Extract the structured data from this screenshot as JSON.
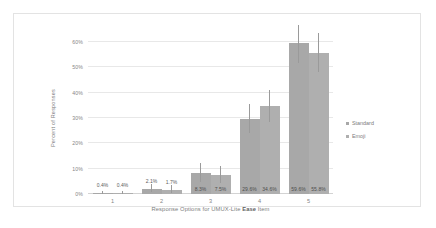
{
  "chart_data": {
    "type": "bar",
    "title": "",
    "xlabel_parts": {
      "before": "Response Options for UMUX-Lite ",
      "bold": "Ease",
      "after": " Item"
    },
    "xlabel": "Response Options for UMUX-Lite Ease Item",
    "ylabel": "Percent of Responses",
    "categories": [
      "1",
      "2",
      "3",
      "4",
      "5"
    ],
    "ylim": [
      0,
      60
    ],
    "yticks": [
      "0%",
      "10%",
      "20%",
      "30%",
      "40%",
      "50%",
      "60%"
    ],
    "ytick_values": [
      0,
      10,
      20,
      30,
      40,
      50,
      60
    ],
    "grid": "horizontal",
    "legend_position": "right",
    "series": [
      {
        "name": "Standard",
        "color": "#a8a8a8",
        "values": [
          0.4,
          2.1,
          8.3,
          29.6,
          59.6
        ],
        "labels": [
          "0.4%",
          "2.1%",
          "8.3%",
          "29.6%",
          "59.6%"
        ],
        "error_low": [
          0.0,
          0.6,
          4.8,
          24.2,
          51.6
        ],
        "error_high": [
          1.3,
          4.0,
          12.1,
          35.4,
          66.6
        ]
      },
      {
        "name": "Emoji",
        "color": "#afafaf",
        "values": [
          0.4,
          1.7,
          7.5,
          34.6,
          55.8
        ],
        "labels": [
          "0.4%",
          "1.7%",
          "7.5%",
          "34.6%",
          "55.8%"
        ],
        "error_low": [
          0.0,
          0.4,
          4.2,
          28.5,
          48.2
        ],
        "error_high": [
          1.3,
          3.6,
          11.2,
          41.0,
          63.4
        ]
      }
    ]
  },
  "legend": {
    "items": [
      {
        "label": "Standard",
        "color": "#a8a8a8"
      },
      {
        "label": "Emoji",
        "color": "#afafaf"
      }
    ]
  }
}
